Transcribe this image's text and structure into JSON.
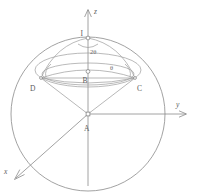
{
  "figure": {
    "type": "geometry-diagram",
    "background_color": "#ffffff",
    "line_color": "#8a8a8a",
    "label_color": "#5d5d5d"
  },
  "axes": {
    "z": {
      "label": "z",
      "direction": "up",
      "arrow": true
    },
    "y": {
      "label": "y",
      "direction": "right",
      "arrow": true
    },
    "x": {
      "label": "x",
      "direction": "down-left",
      "arrow": true
    }
  },
  "points": [
    {
      "id": "I",
      "label": "I",
      "marker": "open-circle",
      "description": "top of sphere on z-axis"
    },
    {
      "id": "B",
      "label": "B",
      "marker": "open-circle",
      "description": "center of upper circular cross-section"
    },
    {
      "id": "D",
      "label": "D",
      "marker": "none",
      "description": "left endpoint of cross-section chord"
    },
    {
      "id": "C",
      "label": "C",
      "marker": "none",
      "description": "right endpoint of cross-section chord"
    },
    {
      "id": "A",
      "label": "A",
      "marker": "open-square",
      "description": "origin, apex of cone"
    }
  ],
  "angles": [
    {
      "id": "two-theta",
      "label": "2θ",
      "vertex": "I",
      "description": "apex angle at I between IC and ID, marked on z-axis below I"
    },
    {
      "id": "theta-right",
      "label": "θ",
      "vertex": "C",
      "description": "angle at C between chord and arc"
    },
    {
      "id": "theta-left",
      "label": "",
      "vertex": "D",
      "description": "matching angle arc at D, unlabeled"
    }
  ],
  "shapes": [
    {
      "id": "great-circle",
      "type": "circle",
      "description": "large sphere outline circle centered at A"
    },
    {
      "id": "upper-ellipse-outer",
      "type": "ellipse",
      "description": "sphere latitude ellipse through D and C"
    },
    {
      "id": "upper-ellipse-inner",
      "type": "ellipse",
      "description": "cross-section circle through B, D and C in perspective"
    },
    {
      "id": "cone-left-edge",
      "type": "line",
      "description": "segment from A to D"
    },
    {
      "id": "cone-right-edge",
      "type": "line",
      "description": "segment from A to C"
    },
    {
      "id": "chord-dc",
      "type": "line",
      "description": "segment from D to C through B"
    },
    {
      "id": "arc-idc",
      "type": "arc",
      "description": "arc from I to C"
    },
    {
      "id": "arc-idd",
      "type": "arc",
      "description": "arc from I to D"
    }
  ]
}
